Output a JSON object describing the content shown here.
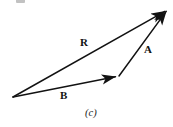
{
  "figure": {
    "caption": "(c)",
    "background_color": "#ffffff",
    "stroke_color": "#121212",
    "labels": {
      "resultant": "R",
      "vector_a": "A",
      "vector_b": "B"
    },
    "geometry": {
      "origin": {
        "x": 13,
        "y": 97
      },
      "junction": {
        "x": 119,
        "y": 76
      },
      "head": {
        "x": 168,
        "y": 9
      }
    },
    "vectors": [
      {
        "name": "B",
        "label": "B",
        "from": {
          "x": 13,
          "y": 97
        },
        "to": {
          "x": 119,
          "y": 76
        },
        "label_position": {
          "x": 60,
          "y": 90
        }
      },
      {
        "name": "A",
        "label": "A",
        "from": {
          "x": 119,
          "y": 76
        },
        "to": {
          "x": 168,
          "y": 9
        },
        "label_position": {
          "x": 144,
          "y": 44
        }
      },
      {
        "name": "R",
        "label": "R",
        "from": {
          "x": 13,
          "y": 97
        },
        "to": {
          "x": 168,
          "y": 9
        },
        "label_position": {
          "x": 80,
          "y": 37
        }
      }
    ]
  }
}
